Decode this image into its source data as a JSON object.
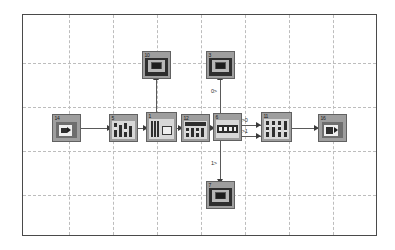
{
  "diagram": {
    "frame": {
      "x": 22,
      "y": 14,
      "width": 355,
      "height": 222
    },
    "grid": {
      "vertical_x": [
        68,
        112,
        156,
        200,
        244,
        288,
        332
      ],
      "horizontal_y": [
        62,
        106,
        150,
        194
      ],
      "style": "dashed",
      "color": "#bdbdbd"
    },
    "blocks": [
      {
        "id": "14",
        "name": "source-block",
        "kind": "input-port",
        "x": 51,
        "y": 113,
        "width": 29,
        "height": 28
      },
      {
        "id": "5",
        "name": "filter-block",
        "kind": "multi-signal",
        "x": 108,
        "y": 113,
        "width": 29,
        "height": 28
      },
      {
        "id": "1",
        "name": "processing-block",
        "kind": "subsystem",
        "x": 145,
        "y": 111,
        "width": 31,
        "height": 30
      },
      {
        "id": "12",
        "name": "mux-block",
        "kind": "bus-selector",
        "x": 180,
        "y": 113,
        "width": 29,
        "height": 28
      },
      {
        "id": "6",
        "name": "demux-block",
        "kind": "signal-router",
        "x": 212,
        "y": 112,
        "width": 29,
        "height": 28
      },
      {
        "id": "11",
        "name": "matrix-block",
        "kind": "gain-array",
        "x": 260,
        "y": 111,
        "width": 31,
        "height": 30
      },
      {
        "id": "16",
        "name": "sink-block",
        "kind": "output-port",
        "x": 317,
        "y": 113,
        "width": 29,
        "height": 28
      },
      {
        "id": "10",
        "name": "scope-block-top-left",
        "kind": "scope",
        "x": 141,
        "y": 50,
        "width": 29,
        "height": 28
      },
      {
        "id": "3",
        "name": "scope-block-top-right",
        "kind": "scope",
        "x": 205,
        "y": 50,
        "width": 29,
        "height": 28
      },
      {
        "id": "7",
        "name": "scope-block-bottom",
        "kind": "scope",
        "x": 205,
        "y": 180,
        "width": 29,
        "height": 28
      }
    ],
    "signal_labels": [
      {
        "name": "signal-label-top-branch",
        "text": "0>",
        "x": 210,
        "y": 88
      },
      {
        "name": "signal-label-bottom-branch",
        "text": "1>",
        "x": 210,
        "y": 160
      },
      {
        "name": "signal-label-upper-link",
        "text": "0>0",
        "x": 237,
        "y": 117
      },
      {
        "name": "signal-label-lower-link",
        "text": "1>1",
        "x": 237,
        "y": 127
      }
    ],
    "colors": {
      "block_fill": "#9e9e9e",
      "block_border": "#616161",
      "wire": "#5a5a5a",
      "grid": "#bdbdbd",
      "frame_border": "#4a4a4a",
      "background": "#ffffff"
    }
  }
}
